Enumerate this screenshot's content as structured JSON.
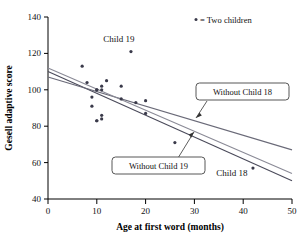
{
  "chart_data": {
    "type": "scatter",
    "title": "",
    "xlabel": "Age at first word (months)",
    "ylabel": "Gesell adaptive score",
    "xlim": [
      0,
      50
    ],
    "ylim": [
      40,
      140
    ],
    "xticks": [
      0,
      10,
      20,
      30,
      40,
      50
    ],
    "yticks": [
      40,
      60,
      80,
      100,
      120,
      140
    ],
    "grid": false,
    "legend": {
      "position": "top-right",
      "entries": [
        {
          "marker": "dot",
          "label": "= Two children"
        }
      ]
    },
    "points": [
      {
        "x": 15,
        "y": 95
      },
      {
        "x": 26,
        "y": 71,
        "note": "Child 18 region"
      },
      {
        "x": 10,
        "y": 83
      },
      {
        "x": 9,
        "y": 91
      },
      {
        "x": 15,
        "y": 102
      },
      {
        "x": 20,
        "y": 87
      },
      {
        "x": 18,
        "y": 93
      },
      {
        "x": 11,
        "y": 100
      },
      {
        "x": 8,
        "y": 104
      },
      {
        "x": 20,
        "y": 94
      },
      {
        "x": 7,
        "y": 113
      },
      {
        "x": 9,
        "y": 96
      },
      {
        "x": 10,
        "y": 83
      },
      {
        "x": 11,
        "y": 84
      },
      {
        "x": 11,
        "y": 102
      },
      {
        "x": 10,
        "y": 100
      },
      {
        "x": 12,
        "y": 105
      },
      {
        "x": 42,
        "y": 57,
        "label": "Child 18"
      },
      {
        "x": 17,
        "y": 121,
        "label": "Child 19"
      },
      {
        "x": 11,
        "y": 86
      },
      {
        "x": 10,
        "y": 100
      }
    ],
    "annotated_points": [
      {
        "label": "Child 19",
        "x": 17,
        "y": 121
      },
      {
        "label": "Child 18",
        "x": 42,
        "y": 57
      }
    ],
    "lines": [
      {
        "name": "all-data",
        "label": "",
        "x": [
          0,
          50
        ],
        "y": [
          110,
          50
        ],
        "color": "#4a4a5a"
      },
      {
        "name": "without-child-18",
        "label": "Without Child 18",
        "x": [
          0,
          50
        ],
        "y": [
          107,
          67
        ],
        "color": "#6a6a78"
      },
      {
        "name": "without-child-19",
        "label": "Without Child 19",
        "x": [
          0,
          50
        ],
        "y": [
          112,
          54
        ],
        "color": "#8a8a96"
      }
    ],
    "callouts": [
      {
        "name": "without-child-18",
        "text": "Without Child 18"
      },
      {
        "name": "without-child-19",
        "text": "Without Child 19"
      }
    ]
  },
  "axes": {
    "x_title": "Age at first word (months)",
    "y_title": "Gesell adaptive score",
    "x_tick_labels": [
      "0",
      "10",
      "20",
      "30",
      "40",
      "50"
    ],
    "y_tick_labels": [
      "40",
      "60",
      "80",
      "100",
      "120",
      "140"
    ]
  },
  "legend": {
    "entry_label": "= Two children"
  },
  "callouts": {
    "without_child_18": "Without Child 18",
    "without_child_19": "Without Child 19"
  },
  "point_labels": {
    "child_19": "Child 19",
    "child_18": "Child 18"
  },
  "colors": {
    "background": "#ffffff",
    "axis": "#000000",
    "marker": "#3a3a4a",
    "line_all": "#4a4a5a",
    "line_no18": "#6a6a78",
    "line_no19": "#8a8a96",
    "callout_border": "#444444"
  }
}
